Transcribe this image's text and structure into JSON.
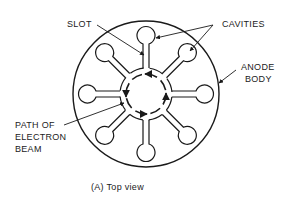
{
  "diagram": {
    "title": "(A)  Top view",
    "labels": {
      "slot": "SLOT",
      "cavities": "CAVITIES",
      "anode_line1": "ANODE",
      "anode_line2": "BODY",
      "path_line1": "PATH OF",
      "path_line2": "ELECTRON",
      "path_line3": "BEAM"
    },
    "cavity_count": 8,
    "stroke_color": "#1a1a1a",
    "background": "#ffffff"
  }
}
